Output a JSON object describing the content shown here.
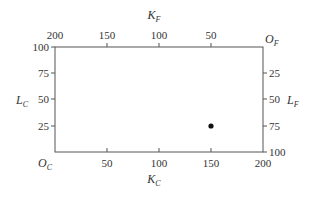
{
  "diagram": {
    "type": "edgeworth-box",
    "box": {
      "x0": 55,
      "y0": 47,
      "x1": 263,
      "y1": 152
    },
    "origins": {
      "country_c": {
        "label": "O",
        "sub": "C"
      },
      "country_f": {
        "label": "O",
        "sub": "F"
      }
    },
    "axes": {
      "bottom": {
        "label": "K",
        "sub": "C",
        "ticks": [
          "50",
          "100",
          "150",
          "200"
        ]
      },
      "top": {
        "label": "K",
        "sub": "F",
        "ticks": [
          "200",
          "150",
          "100",
          "50"
        ]
      },
      "left": {
        "label": "L",
        "sub": "C",
        "ticks": [
          "100",
          "75",
          "50",
          "25"
        ]
      },
      "right": {
        "label": "L",
        "sub": "F",
        "ticks": [
          "25",
          "50",
          "75",
          "100"
        ]
      }
    },
    "point": {
      "K_C": 150,
      "L_C": 25,
      "K_F": 50,
      "L_F": 75
    },
    "colors": {
      "line": "#555555",
      "point": "#111111",
      "text": "#333333"
    }
  }
}
